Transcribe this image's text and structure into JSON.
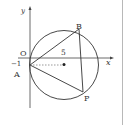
{
  "figure": {
    "axes": {
      "x_label": "x",
      "y_label": "y",
      "origin_label": "O",
      "tick_y": "−1",
      "tick_x_center": "5"
    },
    "points": {
      "A": {
        "label": "A",
        "coord": [
          0,
          -1
        ]
      },
      "B": {
        "label": "B"
      },
      "P": {
        "label": "P"
      },
      "center": {
        "coord": [
          5,
          -1
        ]
      }
    },
    "circle": {
      "center": [
        5,
        -1
      ],
      "passes_through": [
        "A",
        "B",
        "P"
      ]
    },
    "segments": [
      "AB",
      "BP",
      "PA"
    ],
    "dashed": "A to center",
    "colors": {
      "stroke": "#333333",
      "background": "#ffffff",
      "separator": "#b8b8b8"
    }
  }
}
